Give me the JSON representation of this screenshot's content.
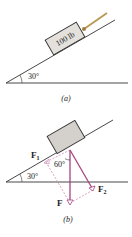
{
  "figure_a": {
    "block_label": "100 lb",
    "angle_label": "30°",
    "caption": "(a)"
  },
  "figure_b": {
    "f1_label": "F",
    "f1_sub": "1",
    "f2_label": "F",
    "f2_sub": "2",
    "f_label": "F",
    "angle_60_label": "60°",
    "angle_30_label": "30°",
    "caption": "(b)"
  },
  "colors": {
    "vector": "#a8447f",
    "vector_dashed": "#d68ab4",
    "block_fill": "#d9d5d0",
    "line": "#333333",
    "rope": "#b99a55"
  }
}
